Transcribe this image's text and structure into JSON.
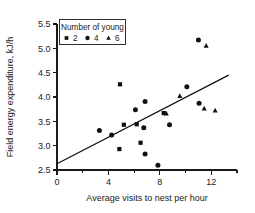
{
  "chart_data": {
    "type": "scatter",
    "title": "",
    "xlabel": "Average visits to nest per hour",
    "ylabel": "Field energy expenditure, kJ/h",
    "xlim": [
      0,
      14
    ],
    "ylim": [
      2.5,
      5.5
    ],
    "xticks": [
      0,
      4,
      8,
      12
    ],
    "xticklabels": [
      "0",
      "4",
      "8",
      "12"
    ],
    "xminorticks": [
      2,
      6,
      10,
      14
    ],
    "yticks": [
      2.5,
      3.0,
      3.5,
      4.0,
      4.5,
      5.0,
      5.5
    ],
    "yticklabels": [
      "2.5",
      "3.0",
      "3.5",
      "4.0",
      "4.5",
      "5.0",
      "5.5"
    ],
    "grid": false,
    "legend": {
      "title": "Number of young",
      "position": "top-left",
      "entries": [
        {
          "label": "2",
          "marker": "square"
        },
        {
          "label": "4",
          "marker": "circle"
        },
        {
          "label": "6",
          "marker": "triangle"
        }
      ]
    },
    "series": [
      {
        "name": "2",
        "marker": "square",
        "points": [
          {
            "x": 4.9,
            "y": 4.26
          },
          {
            "x": 5.2,
            "y": 3.43
          },
          {
            "x": 4.85,
            "y": 2.93
          },
          {
            "x": 6.2,
            "y": 3.44
          },
          {
            "x": 6.5,
            "y": 3.06
          },
          {
            "x": 8.3,
            "y": 3.67
          }
        ]
      },
      {
        "name": "4",
        "marker": "circle",
        "points": [
          {
            "x": 3.3,
            "y": 3.31
          },
          {
            "x": 4.25,
            "y": 3.22
          },
          {
            "x": 6.1,
            "y": 3.74
          },
          {
            "x": 6.85,
            "y": 3.91
          },
          {
            "x": 6.75,
            "y": 3.37
          },
          {
            "x": 6.85,
            "y": 2.83
          },
          {
            "x": 7.85,
            "y": 2.6
          },
          {
            "x": 8.75,
            "y": 3.43
          },
          {
            "x": 10.1,
            "y": 4.21
          },
          {
            "x": 11.0,
            "y": 5.17
          },
          {
            "x": 11.05,
            "y": 3.87
          }
        ]
      },
      {
        "name": "6",
        "marker": "triangle",
        "points": [
          {
            "x": 8.5,
            "y": 3.66
          },
          {
            "x": 9.55,
            "y": 4.02
          },
          {
            "x": 11.45,
            "y": 3.76
          },
          {
            "x": 11.6,
            "y": 5.05
          },
          {
            "x": 12.3,
            "y": 3.72
          }
        ]
      }
    ],
    "trendline": {
      "x0": 0,
      "y0": 2.63,
      "x1": 13.35,
      "y1": 4.45
    }
  }
}
